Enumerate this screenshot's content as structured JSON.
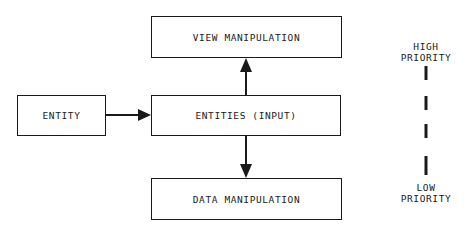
{
  "diagram": {
    "nodes": [
      {
        "id": "entity",
        "label": "ENTITY"
      },
      {
        "id": "entities_input",
        "label": "ENTITIES (INPUT)"
      },
      {
        "id": "view_manipulation",
        "label": "VIEW MANIPULATION"
      },
      {
        "id": "data_manipulation",
        "label": "DATA MANIPULATION"
      }
    ],
    "edges": [
      {
        "from": "entity",
        "to": "entities_input"
      },
      {
        "from": "entities_input",
        "to": "view_manipulation"
      },
      {
        "from": "entities_input",
        "to": "data_manipulation"
      }
    ],
    "priority_scale": {
      "top_label_line1": "HIGH",
      "top_label_line2": "PRIORITY",
      "bottom_label_line1": "LOW",
      "bottom_label_line2": "PRIORITY"
    }
  }
}
